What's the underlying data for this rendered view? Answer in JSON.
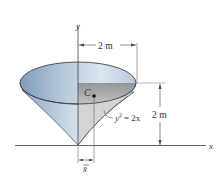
{
  "diagram": {
    "type": "centroid-figure",
    "axes": {
      "x_label": "x",
      "y_label": "y"
    },
    "dimensions": {
      "top_width": "2 m",
      "right_height": "2 m",
      "centroid_offset": "x̄"
    },
    "curve": {
      "equation_lhs": "y",
      "equation_exp": "2",
      "equation_rhs": "= 2x"
    },
    "centroid": {
      "label": "C"
    },
    "colors": {
      "surface_light": "#c9d6e4",
      "surface_dark": "#7f9dbc",
      "section_gray": "#9a9a9a",
      "lines": "#444444",
      "background": "#ffffff"
    }
  }
}
